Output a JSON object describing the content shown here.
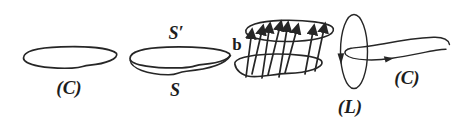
{
  "figure": {
    "background_color": "#ffffff",
    "ink_color": "#262626",
    "panels": {
      "loop_c": {
        "label": "(C)"
      },
      "surface": {
        "boundary_label": "S′",
        "surface_label": "S"
      },
      "flux_tube": {
        "field_label": "b"
      },
      "linked_loops": {
        "loop_label": "(L)",
        "circuit_label": "(C)"
      }
    }
  }
}
